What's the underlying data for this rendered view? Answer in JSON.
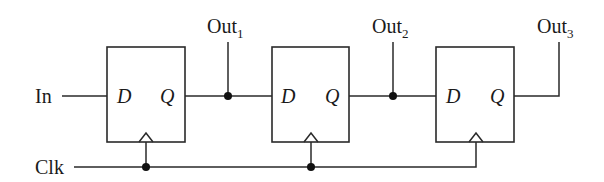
{
  "diagram": {
    "type": "shift-register",
    "inputs": {
      "in_label": "In",
      "clk_label": "Clk"
    },
    "flip_flops": [
      {
        "d_label": "D",
        "q_label": "Q"
      },
      {
        "d_label": "D",
        "q_label": "Q"
      },
      {
        "d_label": "D",
        "q_label": "Q"
      }
    ],
    "outputs": [
      {
        "base": "Out",
        "sub": "1"
      },
      {
        "base": "Out",
        "sub": "2"
      },
      {
        "base": "Out",
        "sub": "3"
      }
    ],
    "colors": {
      "line": "#2a2a2a",
      "background": "#ffffff"
    }
  }
}
